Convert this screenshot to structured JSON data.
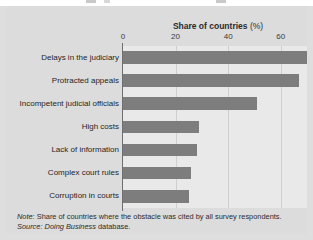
{
  "chart_data": {
    "type": "bar",
    "orientation": "horizontal",
    "title": "",
    "xlabel": "Share of countries (%)",
    "ylabel": "",
    "categories": [
      "Delays in the judiciary",
      "Protracted appeals",
      "Incompetent judicial officials",
      "High costs",
      "Lack of information",
      "Complex court rules",
      "Corruption in courts"
    ],
    "values": [
      70,
      67,
      51,
      29,
      28,
      26,
      25
    ],
    "xlim": [
      0,
      70
    ],
    "xticks": [
      0,
      20,
      40,
      60
    ],
    "xtick_labels": [
      "0",
      "20",
      "40",
      "60"
    ],
    "grid": true,
    "legend": "none",
    "series_color": "#7d7d7d",
    "plot_background": "#e9e9e9",
    "figure_background": "#dcdcdc"
  },
  "axis": {
    "title_strong": "Share of countries",
    "title_units": "(%)"
  },
  "footnotes": {
    "note_label": "Note:",
    "note_text": " Share of countries where the obstacle was cited by all survey respondents.",
    "source_label": "Source:",
    "source_italic": " Doing Business",
    "source_rest": " database."
  }
}
